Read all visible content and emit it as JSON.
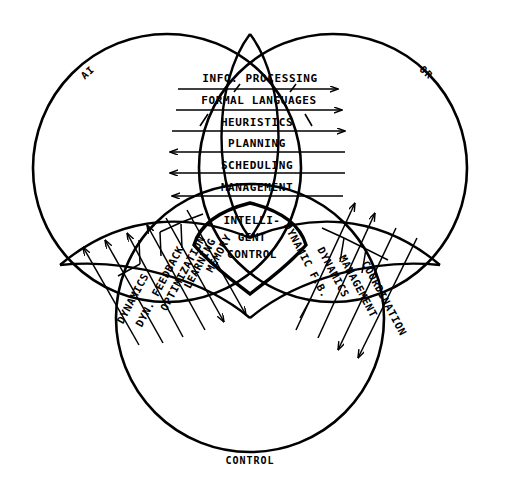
{
  "diagram": {
    "background_color": "#ffffff",
    "stroke_color": "#000000",
    "sets": [
      {
        "id": "ai",
        "label": "AI",
        "cx": 167,
        "cy": 168,
        "r": 134,
        "label_x": 90,
        "label_y": 75,
        "label_rotate": -42
      },
      {
        "id": "or",
        "label": "OR",
        "cx": 333,
        "cy": 168,
        "r": 134,
        "label_x": 424,
        "label_y": 75,
        "label_rotate": 42
      },
      {
        "id": "control",
        "label": "CONTROL",
        "cx": 250,
        "cy": 318,
        "r": 134,
        "label_x": 250,
        "label_y": 460,
        "label_rotate": 0
      }
    ],
    "core": {
      "label_lines": [
        "INTELLI-",
        "GENT",
        "CONTROL"
      ],
      "cx": 250,
      "cy": 238
    },
    "ai_or_bands": {
      "region": "AI ∩ OR",
      "items": [
        {
          "label": "INFO. PROCESSING",
          "direction": "right"
        },
        {
          "label": "FORMAL LANGUAGES",
          "direction": "right"
        },
        {
          "label": "HEURISTICS",
          "direction": "right"
        },
        {
          "label": "PLANNING",
          "direction": "left"
        },
        {
          "label": "SCHEDULING",
          "direction": "left"
        },
        {
          "label": "MANAGEMENT",
          "direction": "left"
        }
      ]
    },
    "ai_control_bands": {
      "region": "AI ∩ CONTROL",
      "items": [
        {
          "label": "DYNAMICS",
          "direction": "up-left"
        },
        {
          "label": "DYN. FEEDBACK",
          "direction": "up-left"
        },
        {
          "label": "OPTIMIZATION",
          "direction": "up-left"
        },
        {
          "label": "LEARNING",
          "direction": "down-right"
        },
        {
          "label": "MEMORY",
          "direction": "down-right"
        }
      ]
    },
    "or_control_bands": {
      "region": "OR ∩ CONTROL",
      "items": [
        {
          "label": "DYNAMIC F.B.",
          "direction": "up-right"
        },
        {
          "label": "DYNAMICS",
          "direction": "up-right"
        },
        {
          "label": "MANAGEMENT",
          "direction": "down-left"
        },
        {
          "label": "COORDINATION",
          "direction": "down-left"
        }
      ]
    }
  }
}
